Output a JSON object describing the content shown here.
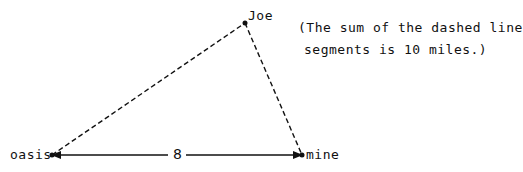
{
  "diagram": {
    "points": {
      "joe": {
        "label": "Joe",
        "x": 245,
        "y": 23
      },
      "oasis": {
        "label": "oasis",
        "x": 52,
        "y": 155
      },
      "mine": {
        "label": "mine",
        "x": 302,
        "y": 155
      }
    },
    "segments": [
      {
        "from": "oasis",
        "to": "joe",
        "style": "dashed"
      },
      {
        "from": "joe",
        "to": "mine",
        "style": "dashed"
      },
      {
        "from": "oasis",
        "to": "mine",
        "style": "solid-double-arrow",
        "label": "8"
      }
    ],
    "note_line1": "(The sum of the dashed line",
    "note_line2": "segments is 10 miles.)",
    "distance_label": "8",
    "colors": {
      "line": "#111111",
      "background": "#ffffff"
    }
  }
}
